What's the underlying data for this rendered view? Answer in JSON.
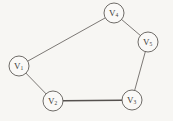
{
  "figure": {
    "background_color": "#f7f6f3",
    "line_color": "#6e6a66",
    "emphasis_line_color": "#55514e",
    "node_fill": "#faf9f7",
    "node_stroke": "#5f5b57",
    "label_color": "#3b3936"
  },
  "chart_data": {
    "type": "diagram",
    "diagram_type": "graph",
    "directed": false,
    "title": "",
    "nodes": [
      {
        "id": "v1",
        "base": "V",
        "subscript": "1",
        "label": "V1",
        "x": 19,
        "y": 66,
        "r": 10
      },
      {
        "id": "v2",
        "base": "V",
        "subscript": "2",
        "label": "V2",
        "x": 53,
        "y": 101,
        "r": 10
      },
      {
        "id": "v3",
        "base": "V",
        "subscript": "3",
        "label": "V3",
        "x": 132,
        "y": 100,
        "r": 10
      },
      {
        "id": "v5",
        "base": "V",
        "subscript": "5",
        "label": "V5",
        "x": 148,
        "y": 42,
        "r": 10
      },
      {
        "id": "v4",
        "base": "V",
        "subscript": "4",
        "label": "V4",
        "x": 114,
        "y": 13,
        "r": 10
      }
    ],
    "edges": [
      {
        "from": "v1",
        "to": "v4",
        "width": 0.9,
        "emphasis": false
      },
      {
        "from": "v4",
        "to": "v5",
        "width": 0.9,
        "emphasis": false
      },
      {
        "from": "v5",
        "to": "v3",
        "width": 0.9,
        "emphasis": false
      },
      {
        "from": "v3",
        "to": "v2",
        "width": 1.5,
        "emphasis": true
      },
      {
        "from": "v2",
        "to": "v1",
        "width": 0.9,
        "emphasis": false
      }
    ],
    "node_count": 5,
    "edge_count": 5
  }
}
